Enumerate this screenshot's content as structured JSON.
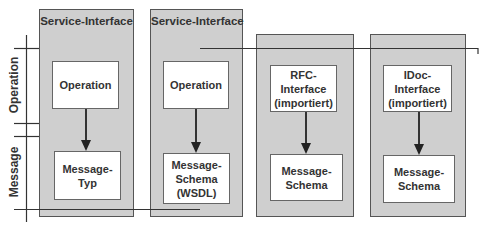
{
  "axis_labels": {
    "operation": "Operation",
    "message": "Message"
  },
  "columns": [
    {
      "title": "Service-Interface",
      "top": "Operation",
      "bottom": "Message-\nTyp"
    },
    {
      "title": "Service-Interface",
      "top": "Operation",
      "bottom": "Message-\nSchema\n(WSDL)"
    },
    {
      "title": "",
      "top": "RFC-Interface\n(importiert)",
      "bottom": "Message-\nSchema"
    },
    {
      "title": "",
      "top": "IDoc-Interface\n(importiert)",
      "bottom": "Message-\nSchema"
    }
  ],
  "colors": {
    "outer_fill": "#cfcfcf",
    "inner_fill": "#ffffff",
    "line": "#333333"
  }
}
